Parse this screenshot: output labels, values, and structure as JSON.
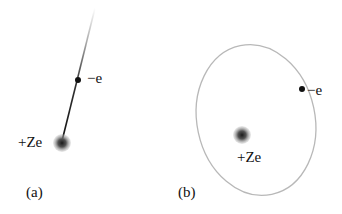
{
  "panels": [
    {
      "id": "a",
      "caption": "(a)",
      "nucleus_label": "+Ze",
      "electron_label": "−e",
      "description": "electron falling along straight line into nucleus"
    },
    {
      "id": "b",
      "caption": "(b)",
      "nucleus_label": "+Ze",
      "electron_label": "−e",
      "description": "electron on elliptical orbit around nucleus"
    }
  ],
  "colors": {
    "nucleus": "#444444",
    "electron": "#111111",
    "orbit": "#b5b5b5",
    "trajectory": "#222222"
  }
}
